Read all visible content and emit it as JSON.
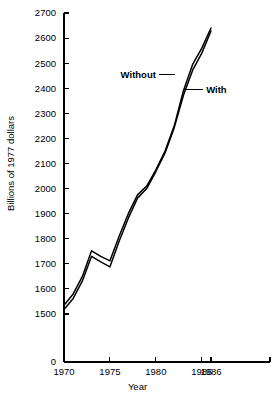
{
  "chart_data": {
    "type": "line",
    "title": "",
    "xlabel": "Year",
    "ylabel": "Billions of 1977 dollars",
    "xlim": [
      1970,
      1986
    ],
    "ylim": [
      1500,
      2700
    ],
    "axis_break_label": "0",
    "grid": false,
    "legend": "inline-annotations",
    "xticks": [
      1970,
      1975,
      1980,
      1985,
      1986
    ],
    "xtick_labels": [
      "1970",
      "1975",
      "1980",
      "1985",
      "1986"
    ],
    "yticks": [
      1500,
      1600,
      1700,
      1800,
      1900,
      2000,
      2100,
      2200,
      2300,
      2400,
      2500,
      2600,
      2700
    ],
    "ytick_labels": [
      "1500",
      "1600",
      "1700",
      "1800",
      "1900",
      "2000",
      "2100",
      "2200",
      "2300",
      "2400",
      "2500",
      "2600",
      "2700"
    ],
    "x": [
      1970,
      1971,
      1972,
      1973,
      1974,
      1975,
      1976,
      1977,
      1978,
      1979,
      1980,
      1981,
      1982,
      1983,
      1984,
      1985,
      1986
    ],
    "series": [
      {
        "name": "Without",
        "label": "Without",
        "color": "#000000",
        "values": [
          1535,
          1580,
          1650,
          1752,
          1730,
          1712,
          1810,
          1900,
          1975,
          2010,
          2075,
          2150,
          2250,
          2390,
          2495,
          2560,
          2640
        ]
      },
      {
        "name": "With",
        "label": "With",
        "color": "#000000",
        "values": [
          1518,
          1562,
          1632,
          1730,
          1708,
          1688,
          1790,
          1882,
          1962,
          2000,
          2068,
          2142,
          2243,
          2372,
          2472,
          2540,
          2628
        ]
      }
    ],
    "annotations": [
      {
        "name": "without-annotation",
        "text": "Without",
        "x": 1980.0,
        "y": 2455
      },
      {
        "name": "with-annotation",
        "text": "With",
        "x": 1984.6,
        "y": 2395
      }
    ]
  },
  "geometry": {
    "plot_left": 64,
    "plot_right": 270,
    "axis_top": 13,
    "axis_bottom": 362,
    "y_value_top": 2700,
    "y_value_bottom": 1500,
    "y_pix_top": 13,
    "y_pix_bottom": 314,
    "x_value_left": 1970,
    "x_value_right": 1986,
    "x_pix_left": 64,
    "x_pix_right": 211
  }
}
